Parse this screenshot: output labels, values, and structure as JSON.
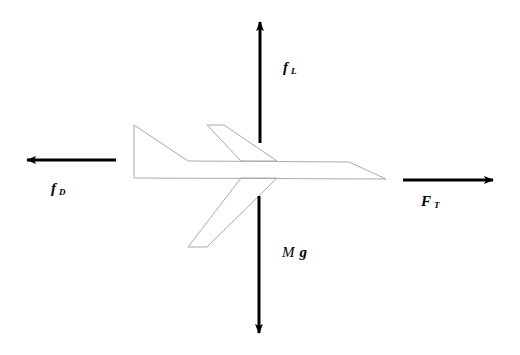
{
  "diagram": {
    "type": "free-body-diagram",
    "colors": {
      "arrow": "#000000",
      "outline": "#aaaaaa",
      "background": "#ffffff"
    },
    "forces": {
      "lift": {
        "symbol": "f",
        "subscript": "L",
        "direction": "up"
      },
      "drag": {
        "symbol": "f",
        "subscript": "D",
        "direction": "left"
      },
      "thrust": {
        "symbol": "F",
        "subscript": "T",
        "direction": "right"
      },
      "weight": {
        "symbol_mass": "M",
        "symbol_g": "g",
        "direction": "down"
      }
    }
  }
}
